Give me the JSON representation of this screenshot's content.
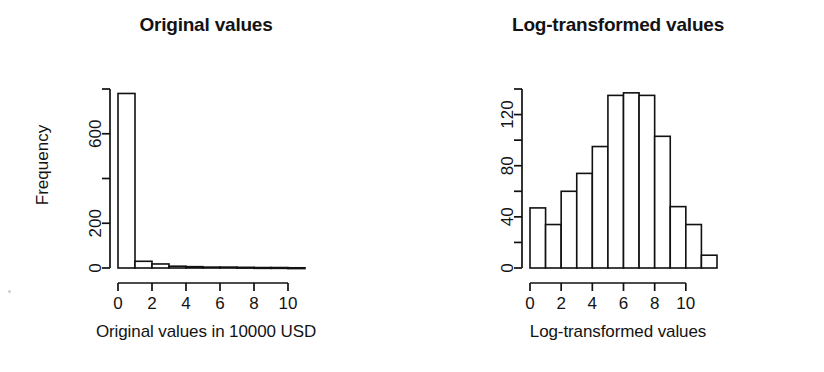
{
  "figure": {
    "width": 824,
    "height": 372,
    "background": "#ffffff",
    "ink_color": "#111111",
    "panel_count": 2
  },
  "panels": {
    "left": {
      "title": "Original values",
      "xlabel": "Original values in 10000 USD",
      "ylabel": "Frequency"
    },
    "right": {
      "title": "Log-transformed values",
      "xlabel": "Log-transformed values",
      "ylabel": "Frequency"
    }
  },
  "chart_data": [
    {
      "type": "bar",
      "title": "Original values",
      "xlabel": "Original values in 10000 USD",
      "ylabel": "Frequency",
      "xlim": [
        0,
        11
      ],
      "ylim": [
        0,
        800
      ],
      "grid": false,
      "legend": null,
      "bin_width": 1,
      "bin_edges": [
        0,
        1,
        2,
        3,
        4,
        5,
        6,
        7,
        8,
        9,
        10,
        11
      ],
      "categories": [
        "0-1",
        "1-2",
        "2-3",
        "3-4",
        "4-5",
        "5-6",
        "6-7",
        "7-8",
        "8-9",
        "9-10",
        "10-11"
      ],
      "values": [
        780,
        30,
        18,
        8,
        6,
        4,
        4,
        3,
        2,
        2,
        1
      ],
      "x_ticks": [
        0,
        2,
        4,
        6,
        8,
        10
      ],
      "x_tick_labels": [
        "0",
        "2",
        "4",
        "6",
        "8",
        "10"
      ],
      "y_ticks": [
        0,
        200,
        400,
        600,
        800
      ],
      "y_tick_labels": [
        "0",
        "200",
        "",
        "600",
        ""
      ],
      "y_labeled_ticks": [
        0,
        200,
        600
      ]
    },
    {
      "type": "bar",
      "title": "Log-transformed values",
      "xlabel": "Log-transformed values",
      "ylabel": "Frequency",
      "xlim": [
        0,
        12
      ],
      "ylim": [
        0,
        140
      ],
      "grid": false,
      "legend": null,
      "bin_width": 1,
      "bin_edges": [
        0,
        1,
        2,
        3,
        4,
        5,
        6,
        7,
        8,
        9,
        10,
        11,
        12
      ],
      "categories": [
        "0-1",
        "1-2",
        "2-3",
        "3-4",
        "4-5",
        "5-6",
        "6-7",
        "7-8",
        "8-9",
        "9-10",
        "10-11",
        "11-12"
      ],
      "values": [
        47,
        34,
        60,
        74,
        95,
        135,
        137,
        135,
        103,
        48,
        34,
        10
      ],
      "x_ticks": [
        0,
        2,
        4,
        6,
        8,
        10
      ],
      "x_tick_labels": [
        "0",
        "2",
        "4",
        "6",
        "8",
        "10"
      ],
      "y_ticks": [
        0,
        20,
        40,
        60,
        80,
        100,
        120,
        140
      ],
      "y_tick_labels": [
        "0",
        "",
        "40",
        "",
        "80",
        "",
        "120",
        ""
      ],
      "y_labeled_ticks": [
        0,
        40,
        80,
        120
      ]
    }
  ]
}
